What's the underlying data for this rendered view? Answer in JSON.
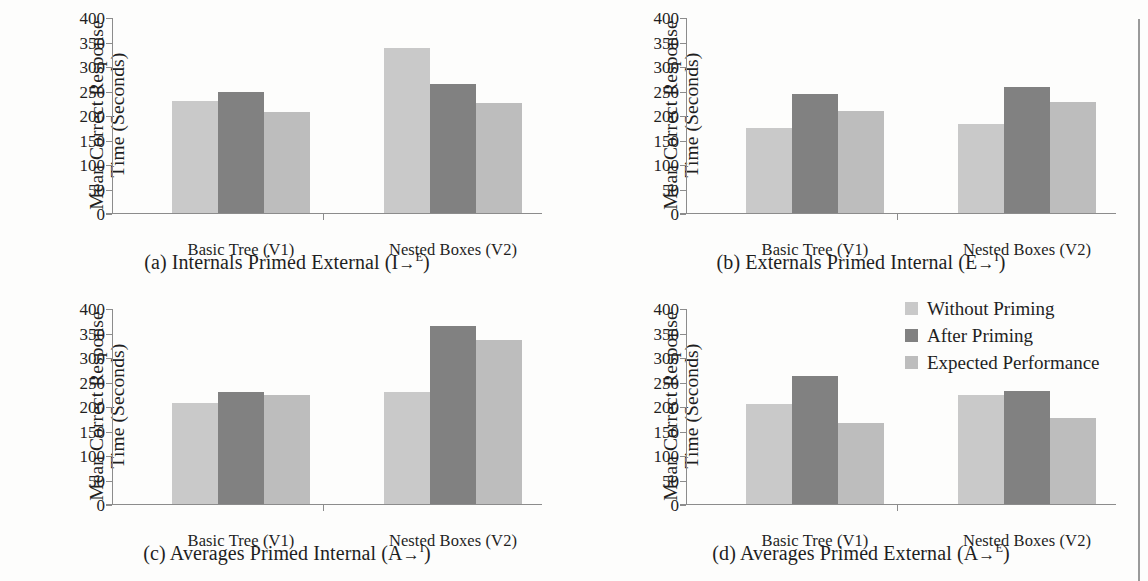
{
  "figure": {
    "axis": {
      "ylabel_line1": "Mean Correct Response",
      "ylabel_line2": "Time (Seconds)",
      "yticks": [
        "400",
        "350",
        "300",
        "250",
        "200",
        "150",
        "100",
        "50",
        "0"
      ],
      "categories": [
        "Basic Tree (V1)",
        "Nested Boxes (V2)"
      ]
    },
    "legend": {
      "items": [
        {
          "label": "Without Priming",
          "color": "#c9c9c9"
        },
        {
          "label": "After Priming",
          "color": "#818181"
        },
        {
          "label": "Expected Performance",
          "color": "#bdbdbd"
        }
      ]
    },
    "panels": [
      {
        "id": "a",
        "caption_prefix": "(a) Internals Primed External (I",
        "caption_arrow": "→",
        "caption_sup": "E",
        "caption_suffix": ")"
      },
      {
        "id": "b",
        "caption_prefix": "(b) Externals Primed Internal (E",
        "caption_arrow": "→",
        "caption_sup": "I",
        "caption_suffix": ")"
      },
      {
        "id": "c",
        "caption_prefix": "(c) Averages Primed Internal (A",
        "caption_arrow": "→",
        "caption_sup": "I",
        "caption_suffix": ")"
      },
      {
        "id": "d",
        "caption_prefix": "(d) Averages Primed External (A",
        "caption_arrow": "→",
        "caption_sup": "E",
        "caption_suffix": ")"
      }
    ]
  },
  "chart_data": [
    {
      "type": "bar",
      "panel": "a",
      "title": "(a) Internals Primed External (I→E)",
      "xlabel": "",
      "ylabel": "Mean Correct Response Time (Seconds)",
      "ylim": [
        0,
        400
      ],
      "yticks": [
        0,
        50,
        100,
        150,
        200,
        250,
        300,
        350,
        400
      ],
      "grid": false,
      "legend_position": "figure-right",
      "categories": [
        "Basic Tree (V1)",
        "Nested Boxes (V2)"
      ],
      "series": [
        {
          "name": "Without Priming",
          "color": "#c9c9c9",
          "values": [
            228,
            337
          ]
        },
        {
          "name": "After Priming",
          "color": "#818181",
          "values": [
            246,
            264
          ]
        },
        {
          "name": "Expected Performance",
          "color": "#bdbdbd",
          "values": [
            207,
            225
          ]
        }
      ]
    },
    {
      "type": "bar",
      "panel": "b",
      "title": "(b) Externals Primed Internal (E→I)",
      "xlabel": "",
      "ylabel": "Mean Correct Response Time (Seconds)",
      "ylim": [
        0,
        400
      ],
      "yticks": [
        0,
        50,
        100,
        150,
        200,
        250,
        300,
        350,
        400
      ],
      "grid": false,
      "legend_position": "figure-right",
      "categories": [
        "Basic Tree (V1)",
        "Nested Boxes (V2)"
      ],
      "series": [
        {
          "name": "Without Priming",
          "color": "#c9c9c9",
          "values": [
            174,
            182
          ]
        },
        {
          "name": "After Priming",
          "color": "#818181",
          "values": [
            243,
            258
          ]
        },
        {
          "name": "Expected Performance",
          "color": "#bdbdbd",
          "values": [
            208,
            227
          ]
        }
      ]
    },
    {
      "type": "bar",
      "panel": "c",
      "title": "(c) Averages Primed Internal (A→I)",
      "xlabel": "",
      "ylabel": "Mean Correct Response Time (Seconds)",
      "ylim": [
        0,
        400
      ],
      "yticks": [
        0,
        50,
        100,
        150,
        200,
        250,
        300,
        350,
        400
      ],
      "grid": false,
      "legend_position": "figure-right",
      "categories": [
        "Basic Tree (V1)",
        "Nested Boxes (V2)"
      ],
      "series": [
        {
          "name": "Without Priming",
          "color": "#c9c9c9",
          "values": [
            207,
            228
          ]
        },
        {
          "name": "After Priming",
          "color": "#818181",
          "values": [
            229,
            363
          ]
        },
        {
          "name": "Expected Performance",
          "color": "#bdbdbd",
          "values": [
            223,
            334
          ]
        }
      ]
    },
    {
      "type": "bar",
      "panel": "d",
      "title": "(d) Averages Primed External (A→E)",
      "xlabel": "",
      "ylabel": "Mean Correct Response Time (Seconds)",
      "ylim": [
        0,
        400
      ],
      "yticks": [
        0,
        50,
        100,
        150,
        200,
        250,
        300,
        350,
        400
      ],
      "grid": false,
      "legend_position": "figure-right",
      "categories": [
        "Basic Tree (V1)",
        "Nested Boxes (V2)"
      ],
      "series": [
        {
          "name": "Without Priming",
          "color": "#c9c9c9",
          "values": [
            204,
            222
          ]
        },
        {
          "name": "After Priming",
          "color": "#818181",
          "values": [
            262,
            230
          ]
        },
        {
          "name": "Expected Performance",
          "color": "#bdbdbd",
          "values": [
            165,
            176
          ]
        }
      ]
    }
  ]
}
